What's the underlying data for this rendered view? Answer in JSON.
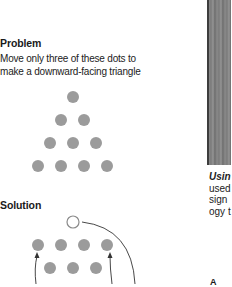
{
  "problem": {
    "heading": "Problem",
    "line1": "Move only three of these dots to",
    "line2": "make a downward-facing triangle"
  },
  "solution": {
    "heading": "Solution"
  },
  "side_caption": {
    "lead": "Usin",
    "lines": [
      "used",
      "sign",
      "ogy t"
    ]
  },
  "footer_fragment": "A",
  "colors": {
    "dot_fill": "#9b9b9b",
    "outline": "#8a8a8a",
    "arrow": "#333333"
  }
}
